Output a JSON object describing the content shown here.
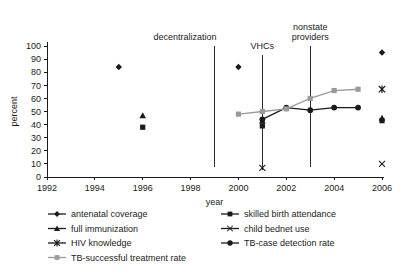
{
  "chart_data": {
    "type": "line",
    "title": "",
    "xlabel": "year",
    "ylabel": "percent",
    "xlim": [
      1992,
      2006
    ],
    "ylim": [
      0,
      100
    ],
    "xticks": [
      1992,
      1994,
      1996,
      1998,
      2000,
      2002,
      2004,
      2006
    ],
    "yticks": [
      0,
      10,
      20,
      30,
      40,
      50,
      60,
      70,
      80,
      90,
      100
    ],
    "grid": false,
    "legend_position": "below",
    "series": [
      {
        "name": "antenatal coverage",
        "marker": "diamond",
        "color": "#1a1a1a",
        "connected": false,
        "points": [
          {
            "x": 1995,
            "y": 84
          },
          {
            "x": 2000,
            "y": 84
          },
          {
            "x": 2006,
            "y": 95
          }
        ]
      },
      {
        "name": "skilled birth attendance",
        "marker": "square",
        "color": "#1a1a1a",
        "connected": false,
        "points": [
          {
            "x": 1996,
            "y": 38
          },
          {
            "x": 2001,
            "y": 39
          },
          {
            "x": 2006,
            "y": 43
          }
        ]
      },
      {
        "name": "full immunization",
        "marker": "triangle",
        "color": "#1a1a1a",
        "connected": false,
        "points": [
          {
            "x": 1996,
            "y": 47
          },
          {
            "x": 2001,
            "y": 43
          },
          {
            "x": 2006,
            "y": 45
          }
        ]
      },
      {
        "name": "child bednet use",
        "marker": "x",
        "color": "#1a1a1a",
        "connected": false,
        "points": [
          {
            "x": 2001,
            "y": 7
          },
          {
            "x": 2006,
            "y": 10
          }
        ]
      },
      {
        "name": "HIV knowledge",
        "marker": "asterisk",
        "color": "#1a1a1a",
        "connected": false,
        "points": [
          {
            "x": 2006,
            "y": 67
          }
        ]
      },
      {
        "name": "TB-case detection rate",
        "marker": "circle",
        "color": "#1a1a1a",
        "connected": true,
        "points": [
          {
            "x": 2001,
            "y": 44
          },
          {
            "x": 2002,
            "y": 53
          },
          {
            "x": 2003,
            "y": 51
          },
          {
            "x": 2004,
            "y": 53
          },
          {
            "x": 2005,
            "y": 53
          }
        ]
      },
      {
        "name": "TB-successful treatment rate",
        "marker": "square",
        "color": "#9a9a9a",
        "connected": true,
        "points": [
          {
            "x": 2000,
            "y": 48
          },
          {
            "x": 2001,
            "y": 50
          },
          {
            "x": 2002,
            "y": 52
          },
          {
            "x": 2003,
            "y": 60
          },
          {
            "x": 2004,
            "y": 66
          },
          {
            "x": 2005,
            "y": 67
          }
        ]
      }
    ],
    "annotations": [
      {
        "label": "decentralization",
        "x": 1999,
        "y_top": 100,
        "y_bottom": 8,
        "label_lines": [
          "decentralization"
        ]
      },
      {
        "label": "VHCs",
        "x": 2001,
        "y_top": 93,
        "y_bottom": 5,
        "label_lines": [
          "VHCs"
        ]
      },
      {
        "label": "nonstate providers",
        "x": 2003,
        "y_top": 100,
        "y_bottom": 8,
        "label_lines": [
          "nonstate",
          "providers"
        ]
      }
    ]
  },
  "legend": {
    "entries": [
      {
        "label": "antenatal coverage",
        "marker": "diamond",
        "color": "#1a1a1a"
      },
      {
        "label": "skilled birth attendance",
        "marker": "square",
        "color": "#1a1a1a"
      },
      {
        "label": "full immunization",
        "marker": "triangle",
        "color": "#1a1a1a"
      },
      {
        "label": "child bednet use",
        "marker": "x",
        "color": "#1a1a1a"
      },
      {
        "label": "HIV knowledge",
        "marker": "asterisk",
        "color": "#1a1a1a"
      },
      {
        "label": "TB-case detection rate",
        "marker": "circle",
        "color": "#1a1a1a"
      },
      {
        "label": "TB-successful treatment rate",
        "marker": "square",
        "color": "#9a9a9a"
      }
    ]
  },
  "colors": {
    "axis": "#1a1a1a",
    "text": "#1a1a1a",
    "grey_series": "#9a9a9a",
    "background": "#ffffff"
  }
}
